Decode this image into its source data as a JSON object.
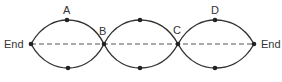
{
  "diagram": {
    "type": "standing-wave",
    "labels": {
      "left_end": "End",
      "right_end": "End",
      "a": "A",
      "b": "B",
      "c": "C",
      "d": "D"
    },
    "colors": {
      "curve": "#333333",
      "axis": "#555555",
      "dot": "#222222"
    },
    "loops": 3,
    "nodes": [
      "End",
      "B",
      "C",
      "End"
    ],
    "antinodes_labeled": [
      "A",
      "D"
    ]
  }
}
